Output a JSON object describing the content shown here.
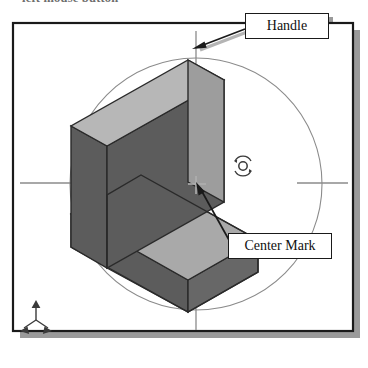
{
  "page": {
    "top_caption": "left mouse button",
    "background": "#ffffff"
  },
  "figure": {
    "name": "rotate-view-figure",
    "frame": {
      "border_color": "#1a1a1a",
      "shadow_color": "#9a9a9a",
      "fill": "#ffffff"
    },
    "rotation_circle": {
      "name": "rotation-circle",
      "center_x": 196,
      "center_y": 184,
      "radius": 126,
      "stroke": "#888888"
    },
    "handles": [
      {
        "name": "handle-top",
        "position": "top"
      },
      {
        "name": "handle-bottom",
        "position": "bottom"
      },
      {
        "name": "handle-left",
        "position": "left"
      },
      {
        "name": "handle-right",
        "position": "right"
      }
    ],
    "center_mark": {
      "name": "center-mark",
      "x": 196,
      "y": 184,
      "symbol": "crosshair"
    },
    "rotate_glyph": {
      "name": "rotate-icon",
      "x": 243,
      "y": 166
    },
    "axis_triad": {
      "name": "axis-triad-icon",
      "x": 36,
      "y": 320,
      "axes": [
        "z-up",
        "x-left",
        "y-right"
      ]
    },
    "solid": {
      "name": "l-shaped-block",
      "colors": {
        "top_face": "#b7b7b7",
        "shelf_face": "#a9a9a9",
        "front_dark_face": "#5c5c5c",
        "side_dark_face": "#676767",
        "outline": "#2a2a2a"
      }
    }
  },
  "annotations": [
    {
      "name": "handle-callout",
      "label": "Handle",
      "leader_from": {
        "x": 245,
        "y": 33
      },
      "leader_to": {
        "x": 194,
        "y": 50
      }
    },
    {
      "name": "center-mark-callout",
      "label": "Center Mark",
      "leader_from": {
        "x": 228,
        "y": 240
      },
      "leader_to": {
        "x": 198,
        "y": 186
      }
    }
  ]
}
